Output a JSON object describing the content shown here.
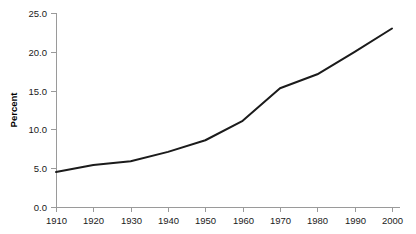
{
  "chart_data": {
    "type": "line",
    "title": "",
    "subtitle": "",
    "xlabel": "",
    "ylabel": "Percent",
    "x": [
      1910,
      1920,
      1930,
      1940,
      1950,
      1960,
      1970,
      1980,
      1990,
      2000
    ],
    "categories": [
      "1910",
      "1920",
      "1930",
      "1940",
      "1950",
      "1960",
      "1970",
      "1980",
      "1990",
      "2000"
    ],
    "series": [
      {
        "name": "Percent",
        "values": [
          4.5,
          5.4,
          5.9,
          7.1,
          8.6,
          11.1,
          15.3,
          17.1,
          20.0,
          23.0
        ]
      }
    ],
    "xlim": [
      1910,
      2000
    ],
    "ylim": [
      0.0,
      25.0
    ],
    "xticks": [
      1910,
      1920,
      1930,
      1940,
      1950,
      1960,
      1970,
      1980,
      1990,
      2000
    ],
    "xtick_labels": [
      "1910",
      "1920",
      "1930",
      "1940",
      "1950",
      "1960",
      "1970",
      "1980",
      "1990",
      "2000"
    ],
    "yticks": [
      0.0,
      5.0,
      10.0,
      15.0,
      20.0,
      25.0
    ],
    "ytick_labels": [
      "0.0",
      "5.0",
      "10.0",
      "15.0",
      "20.0",
      "25.0"
    ],
    "grid": false,
    "legend": false,
    "legend_position": "none",
    "annotations": [],
    "colors": {
      "line": "#1b1b1b",
      "axis": "#9a9a9a",
      "text": "#1a1a1a",
      "background": "#ffffff"
    }
  },
  "axes": {
    "y_axis_title": "Percent"
  }
}
